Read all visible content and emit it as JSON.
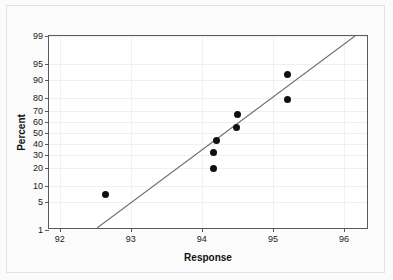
{
  "figure": {
    "type": "normal-probability-plot",
    "background_color": "#fbfbfb",
    "panel_color": "#ffffff",
    "frame_color": "#5a5a5a",
    "point_color": "#101010",
    "line_color": "#6e6e6e"
  },
  "axes": {
    "x_title": "Response",
    "y_title": "Percent"
  },
  "chart_data": {
    "type": "scatter",
    "title": "",
    "subtitle": "",
    "xlabel": "Response",
    "ylabel": "Percent",
    "xlim": [
      91.85,
      96.35
    ],
    "ylim": [
      1,
      99
    ],
    "y_scale": "normal-probability",
    "grid": true,
    "legend": null,
    "xticks": [
      92,
      93,
      94,
      95,
      96
    ],
    "xtick_labels": [
      "92",
      "93",
      "94",
      "95",
      "96"
    ],
    "yticks": [
      1,
      5,
      10,
      20,
      30,
      40,
      50,
      60,
      70,
      80,
      90,
      95,
      99
    ],
    "ytick_labels": [
      "1",
      "5",
      "10",
      "20",
      "30",
      "40",
      "50",
      "60",
      "70",
      "80",
      "90",
      "95",
      "99"
    ],
    "series": [
      {
        "name": "Data points",
        "marker": "filled-circle",
        "x": [
          92.65,
          94.17,
          94.17,
          94.2,
          94.48,
          94.5,
          95.2,
          95.2
        ],
        "y": [
          7,
          20,
          32,
          43,
          55,
          67,
          79,
          92
        ]
      },
      {
        "name": "Fitted distribution line",
        "type": "line",
        "x": [
          92.53,
          96.18
        ],
        "y": [
          1,
          99
        ]
      }
    ],
    "annotations": []
  }
}
